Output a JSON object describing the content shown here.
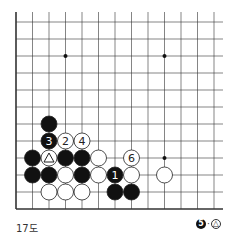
{
  "diagram": {
    "caption": "17도",
    "note": {
      "black_move": "5",
      "separator": "·",
      "at": "△"
    },
    "grid": {
      "x0": 16,
      "y0": 22,
      "dx": 16.5,
      "dy": 17,
      "cols": 13,
      "rows": 12,
      "right_edge_x": 223,
      "top_edge_y": 12,
      "left_border": true,
      "bottom_border": true
    },
    "star_points": [
      [
        3,
        2
      ],
      [
        9,
        2
      ],
      [
        9,
        8
      ]
    ],
    "stones": [
      {
        "col": 2,
        "row": 6,
        "color": "black",
        "label": ""
      },
      {
        "col": 2,
        "row": 7,
        "color": "black",
        "label": "3"
      },
      {
        "col": 3,
        "row": 7,
        "color": "white",
        "label": "2"
      },
      {
        "col": 4,
        "row": 7,
        "color": "white",
        "label": "4"
      },
      {
        "col": 1,
        "row": 8,
        "color": "black",
        "label": ""
      },
      {
        "col": 2,
        "row": 8,
        "color": "white",
        "label": "△"
      },
      {
        "col": 3,
        "row": 8,
        "color": "black",
        "label": ""
      },
      {
        "col": 4,
        "row": 8,
        "color": "black",
        "label": ""
      },
      {
        "col": 5,
        "row": 8,
        "color": "white",
        "label": ""
      },
      {
        "col": 7,
        "row": 8,
        "color": "white",
        "label": "6"
      },
      {
        "col": 1,
        "row": 9,
        "color": "black",
        "label": ""
      },
      {
        "col": 2,
        "row": 9,
        "color": "black",
        "label": ""
      },
      {
        "col": 3,
        "row": 9,
        "color": "white",
        "label": ""
      },
      {
        "col": 4,
        "row": 9,
        "color": "black",
        "label": ""
      },
      {
        "col": 5,
        "row": 9,
        "color": "white",
        "label": ""
      },
      {
        "col": 6,
        "row": 9,
        "color": "black",
        "label": "1"
      },
      {
        "col": 7,
        "row": 9,
        "color": "white",
        "label": ""
      },
      {
        "col": 9,
        "row": 9,
        "color": "white",
        "label": ""
      },
      {
        "col": 2,
        "row": 10,
        "color": "white",
        "label": ""
      },
      {
        "col": 3,
        "row": 10,
        "color": "white",
        "label": ""
      },
      {
        "col": 4,
        "row": 10,
        "color": "white",
        "label": ""
      },
      {
        "col": 6,
        "row": 10,
        "color": "black",
        "label": ""
      },
      {
        "col": 7,
        "row": 10,
        "color": "black",
        "label": ""
      }
    ]
  }
}
